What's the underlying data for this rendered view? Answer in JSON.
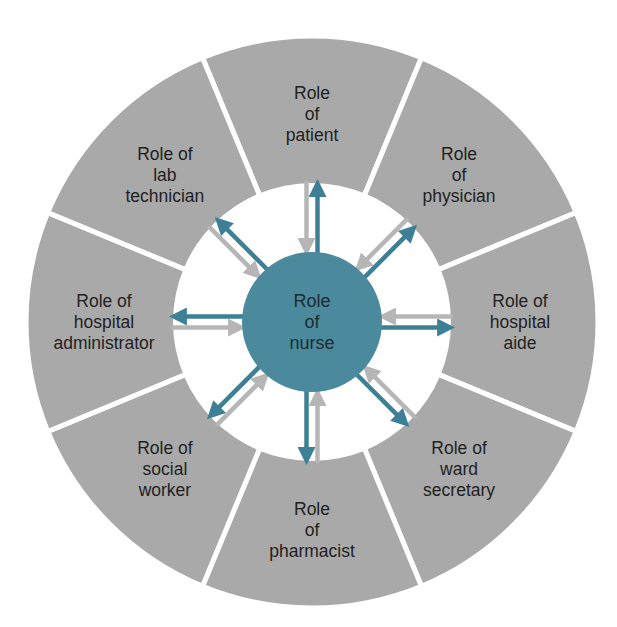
{
  "diagram": {
    "center": {
      "label_lines": [
        "Role",
        "of",
        "nurse"
      ]
    },
    "segments": [
      {
        "id": "patient",
        "label_lines": [
          "Role",
          "of",
          "patient"
        ],
        "angle_deg": -90
      },
      {
        "id": "physician",
        "label_lines": [
          "Role",
          "of",
          "physician"
        ],
        "angle_deg": -45
      },
      {
        "id": "hospital-aide",
        "label_lines": [
          "Role of",
          "hospital",
          "aide"
        ],
        "angle_deg": 0
      },
      {
        "id": "ward-secretary",
        "label_lines": [
          "Role of",
          "ward",
          "secretary"
        ],
        "angle_deg": 45
      },
      {
        "id": "pharmacist",
        "label_lines": [
          "Role",
          "of",
          "pharmacist"
        ],
        "angle_deg": 90
      },
      {
        "id": "social-worker",
        "label_lines": [
          "Role of",
          "social",
          "worker"
        ],
        "angle_deg": 135
      },
      {
        "id": "hospital-administrator",
        "label_lines": [
          "Role of",
          "hospital",
          "administrator"
        ],
        "angle_deg": 180
      },
      {
        "id": "lab-technician",
        "label_lines": [
          "Role of",
          "lab",
          "technician"
        ],
        "angle_deg": -135
      }
    ],
    "arrows": {
      "outward_description": "Teal arrow from nurse outward to each role",
      "inward_description": "Gray arrow from each role inward to nurse"
    },
    "colors": {
      "segment_fill": "#a9a9a9",
      "divider": "#ffffff",
      "inner_ring": "#ffffff",
      "center_fill": "#4b8a9d",
      "arrow_outward": "#3d8096",
      "arrow_inward": "#b6b6b6"
    },
    "geometry": {
      "cx": 312,
      "cy": 322,
      "outer_r": 286,
      "inner_r": 139,
      "center_r": 70,
      "label_r": 208
    }
  }
}
